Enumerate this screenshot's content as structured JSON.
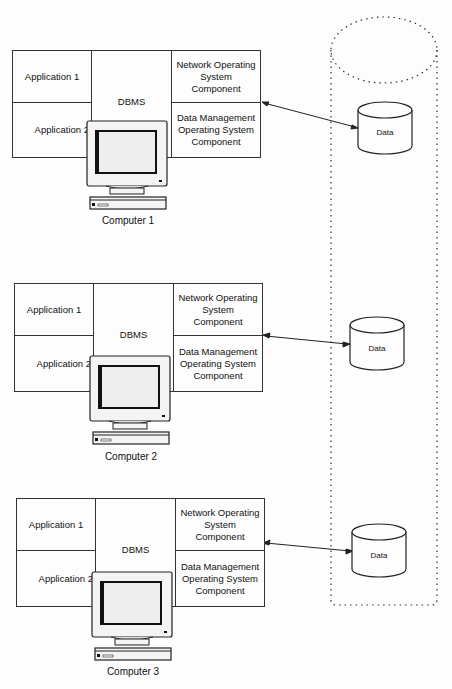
{
  "diagram": {
    "type": "distributed-database-architecture",
    "computers": [
      {
        "name": "Computer 1",
        "application_1": "Application 1",
        "application_2": "Application 2",
        "dbms": "DBMS",
        "network_os": "Network Operating System Component",
        "data_mgmt_os": "Data Management Operating System Component",
        "data_store": "Data"
      },
      {
        "name": "Computer 2",
        "application_1": "Application 1",
        "application_2": "Application 2",
        "dbms": "DBMS",
        "network_os": "Network Operating System Component",
        "data_mgmt_os": "Data Management Operating System Component",
        "data_store": "Data"
      },
      {
        "name": "Computer 3",
        "application_1": "Application 1",
        "application_2": "Application 2",
        "dbms": "DBMS",
        "network_os": "Network Operating System Component",
        "data_mgmt_os": "Data Management Operating System Component",
        "data_store": "Data"
      }
    ],
    "connections": [
      {
        "from": "Computer 1 OS components",
        "to": "Data 1",
        "style": "bidirectional-arrow"
      },
      {
        "from": "Computer 2 OS components",
        "to": "Data 2",
        "style": "bidirectional-arrow"
      },
      {
        "from": "Computer 3 OS components",
        "to": "Data 3",
        "style": "bidirectional-arrow"
      }
    ],
    "enclosure": {
      "shape": "dotted-cylinder",
      "contains": [
        "Data 1",
        "Data 2",
        "Data 3"
      ]
    }
  }
}
